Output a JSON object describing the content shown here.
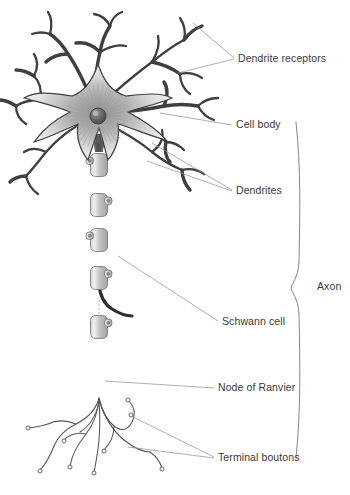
{
  "figure": {
    "background_color": "#ffffff",
    "line_color": "#3f3f3f",
    "leader_color": "#8d8d8d",
    "text_color": "#3a3a3a"
  },
  "labels": [
    {
      "id": "dendrite-receptors",
      "text": "Dendrite receptors",
      "x": 238,
      "y": 62
    },
    {
      "id": "cell-body",
      "text": "Cell body",
      "x": 236,
      "y": 128
    },
    {
      "id": "dendrites",
      "text": "Dendrites",
      "x": 236,
      "y": 194
    },
    {
      "id": "axon",
      "text": "Axon",
      "x": 317,
      "y": 290
    },
    {
      "id": "schwann-cell",
      "text": "Schwann cell",
      "x": 222,
      "y": 325
    },
    {
      "id": "node-of-ranvier",
      "text": "Node of Ranvier",
      "x": 218,
      "y": 391
    },
    {
      "id": "terminal-boutons",
      "text": "Terminal boutons",
      "x": 218,
      "y": 461
    }
  ],
  "leaders": {
    "dendrite_receptors": [
      "M 234 58 L 193 23",
      "M 234 59 L 178 73"
    ],
    "cell_body": [
      "M 232 125 L 160 113"
    ],
    "dendrites": [
      "M 232 190 L 152 143",
      "M 232 191 L 147 161"
    ],
    "schwann_cell": [
      "M 218 321 L 118 256"
    ],
    "node_of_ranvier": [
      "M 214 388 L 105 381"
    ],
    "terminal_boutons": [
      "M 214 457 L 131 416",
      "M 214 458 L 128 447"
    ]
  },
  "axon_bracket": {
    "path": "M 296 122 C 301 170 300 210 299 262 C 298 278 292 283 291 288 C 292 293 298 298 299 314 C 300 366 301 410 296 458",
    "top_y": 122,
    "bottom_y": 458
  },
  "soma": {
    "center_x": 98,
    "center_y": 116,
    "nucleus_radius": 8,
    "nucleus_color": "#5a5a5a",
    "fill_light": "#f2f2f2",
    "fill_dark": "#6b6b6b"
  },
  "axon": {
    "start_x": 99,
    "start_y": 148,
    "end_y": 400,
    "width": 3.2
  },
  "myelin_segments": [
    {
      "y": 165,
      "nub": "left"
    },
    {
      "y": 205,
      "nub": "right"
    },
    {
      "y": 240,
      "nub": "left"
    },
    {
      "y": 278,
      "nub": "right"
    },
    {
      "y": 327,
      "nub": "right"
    }
  ],
  "node_of_ranvier_gap": {
    "y": 306
  },
  "dendrite_branches": [
    "M 98 112 C 92 92 96 70 100 52 C 102 40 106 32 110 26",
    "M 110 26 C 112 18 116 14 122 12",
    "M 110 26 C 106 18 100 15 94 14",
    "M 100 52 C 92 44 84 42 76 43",
    "M 100 52 C 110 46 118 44 126 46",
    "M 103 104 C 118 88 136 74 152 62 C 162 54 172 46 184 40",
    "M 184 40 C 190 32 196 28 202 26",
    "M 184 40 C 186 32 184 24 180 18",
    "M 152 62 C 158 52 160 44 158 36",
    "M 152 62 C 162 64 172 68 180 74",
    "M 180 74 C 188 72 196 74 202 78",
    "M 180 74 C 180 82 184 90 190 94",
    "M 106 112 C 126 112 146 110 164 106 C 176 104 188 104 198 106",
    "M 198 106 C 204 100 212 98 218 98",
    "M 198 106 C 202 114 208 118 214 120",
    "M 164 106 C 168 96 168 88 164 82",
    "M 104 122 C 120 130 138 140 152 152 C 162 160 172 166 182 170",
    "M 182 170 C 190 168 198 170 204 174",
    "M 182 170 C 182 178 186 186 190 190",
    "M 152 152 C 160 146 164 138 162 130",
    "M 92 110 C 74 104 56 100 40 100 C 30 100 22 102 16 106",
    "M 16 106 C 10 102 4 100 -2 100",
    "M 16 106 C 16 114 20 120 26 124",
    "M 40 100 C 42 90 40 82 34 76",
    "M 34 76 C 28 72 22 70 16 70",
    "M 34 76 C 38 68 38 60 34 54",
    "M 92 118 C 74 126 58 138 46 152 C 38 162 32 170 26 176",
    "M 26 176 C 20 176 14 178 10 182",
    "M 26 176 C 28 184 32 190 38 194",
    "M 46 152 C 38 148 30 148 24 152",
    "M 94 106 C 86 86 78 68 68 54 C 62 44 56 38 50 34",
    "M 50 34 C 44 32 38 32 32 34",
    "M 50 34 C 52 26 52 18 48 12",
    "M 68 54 C 60 54 52 56 46 62",
    "M 128 114 C 142 120 156 130 166 142",
    "M 166 142 C 174 142 180 146 184 150",
    "M 166 142 C 164 150 166 158 170 162"
  ],
  "terminal_branches": [
    "M 99 398 C 96 410 88 418 76 424 C 66 429 58 436 54 446",
    "M 54 446 C 50 456 46 464 40 470",
    "M 76 424 C 66 420 56 420 48 424",
    "M 48 424 C 40 426 34 428 28 428",
    "M 99 398 C 98 412 94 424 86 434 C 78 444 72 454 70 466",
    "M 99 400 C 100 414 100 428 99 440 C 98 452 96 462 94 472",
    "M 99 398 C 102 410 106 420 114 426 C 122 432 128 430 132 422 C 136 414 134 406 128 400",
    "M 99 400 C 104 416 112 430 124 440 C 134 448 142 452 150 452",
    "M 150 452 C 156 456 160 462 162 468",
    "M 99 402 C 96 416 90 426 80 432",
    "M 86 434 C 78 432 70 434 64 440",
    "M 114 426 C 114 436 110 444 104 450"
  ],
  "terminal_knobs": [
    {
      "x": 40,
      "y": 471,
      "r": 2.0
    },
    {
      "x": 28,
      "y": 428,
      "r": 2.0
    },
    {
      "x": 70,
      "y": 467,
      "r": 2.0
    },
    {
      "x": 94,
      "y": 473,
      "r": 2.0
    },
    {
      "x": 128,
      "y": 400,
      "r": 2.0
    },
    {
      "x": 162,
      "y": 469,
      "r": 2.0
    },
    {
      "x": 64,
      "y": 441,
      "r": 2.0
    },
    {
      "x": 104,
      "y": 451,
      "r": 2.0
    },
    {
      "x": 131,
      "y": 415,
      "r": 2.0
    }
  ]
}
